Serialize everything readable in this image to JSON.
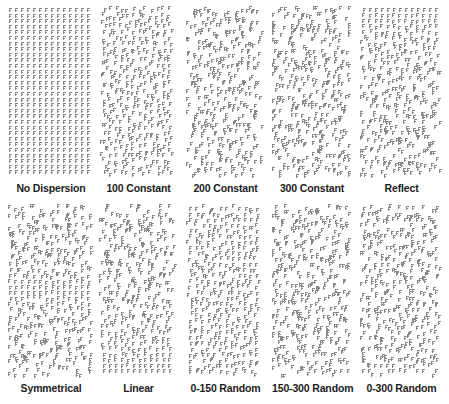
{
  "figure": {
    "background_color": "#ffffff",
    "glyph_color": "#8a8a8a",
    "label_color": "#1b1b1b",
    "columns": 5,
    "rows": 2
  },
  "panels": [
    {
      "label": "No Dispersion",
      "row": 1,
      "column": 1,
      "x": 8,
      "y": 6,
      "width": 86,
      "height": 172,
      "mode": "none",
      "jitter": 0,
      "seed": 101
    },
    {
      "label": "100 Constant",
      "row": 1,
      "column": 2,
      "x": 99,
      "y": 6,
      "width": 79,
      "height": 172,
      "mode": "constant",
      "jitter": 100,
      "seed": 202
    },
    {
      "label": "200 Constant",
      "row": 1,
      "column": 3,
      "x": 186,
      "y": 6,
      "width": 79,
      "height": 172,
      "mode": "constant",
      "jitter": 200,
      "seed": 303
    },
    {
      "label": "300 Constant",
      "row": 1,
      "column": 4,
      "x": 272,
      "y": 6,
      "width": 80,
      "height": 172,
      "mode": "constant",
      "jitter": 300,
      "seed": 404
    },
    {
      "label": "Reflect",
      "row": 1,
      "column": 5,
      "x": 360,
      "y": 6,
      "width": 83,
      "height": 172,
      "mode": "reflect",
      "jitter": 300,
      "seed": 505
    },
    {
      "label": "Symmetrical",
      "row": 2,
      "column": 1,
      "x": 8,
      "y": 204,
      "width": 86,
      "height": 174,
      "mode": "symmetrical",
      "jitter": 300,
      "seed": 606
    },
    {
      "label": "Linear",
      "row": 2,
      "column": 2,
      "x": 99,
      "y": 204,
      "width": 79,
      "height": 174,
      "mode": "linear",
      "jitter": 300,
      "seed": 707
    },
    {
      "label": "0-150 Random",
      "row": 2,
      "column": 3,
      "x": 186,
      "y": 204,
      "width": 79,
      "height": 174,
      "mode": "random",
      "jitter_min": 0,
      "jitter_max": 150,
      "seed": 808
    },
    {
      "label": "150-300 Random",
      "row": 2,
      "column": 4,
      "x": 272,
      "y": 204,
      "width": 80,
      "height": 174,
      "mode": "random",
      "jitter_min": 150,
      "jitter_max": 300,
      "seed": 909
    },
    {
      "label": "0-300 Random",
      "row": 2,
      "column": 5,
      "x": 360,
      "y": 204,
      "width": 83,
      "height": 174,
      "mode": "random",
      "jitter_min": 0,
      "jitter_max": 300,
      "seed": 1010
    }
  ]
}
